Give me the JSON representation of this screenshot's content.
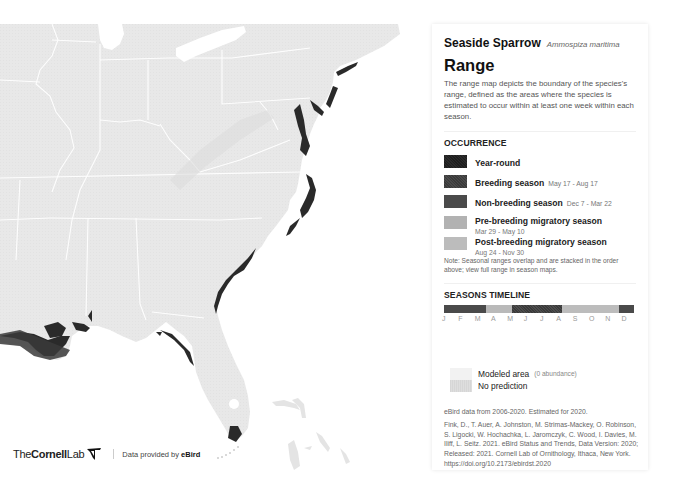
{
  "map": {
    "region": "Eastern United States",
    "footer": {
      "logo_the": "The",
      "logo_cornell": "Cornell",
      "logo_lab": "Lab",
      "data_credit_prefix": "Data provided by ",
      "data_credit_brand": "eBird"
    }
  },
  "panel": {
    "species_common": "Seaside Sparrow",
    "species_scientific": "Ammospiza maritima",
    "title": "Range",
    "description": "The range map depicts the boundary of the species's range, defined as the areas where the species is estimated to occur within at least one week within each season.",
    "occurrence": {
      "heading": "OCCURRENCE",
      "items": [
        {
          "label": "Year-round",
          "dates": "",
          "color": "#222222"
        },
        {
          "label": "Breeding season",
          "dates": "May 17 - Aug 17",
          "color": "#404040"
        },
        {
          "label": "Non-breeding season",
          "dates": "Dec 7 - Mar 22",
          "color": "#4a4a4a"
        },
        {
          "label": "Pre-breeding migratory season",
          "dates": "Mar 29 - May 10",
          "color": "#b2b2b2"
        },
        {
          "label": "Post-breeding migratory season",
          "dates": "Aug 24 - Nov 30",
          "color": "#bcbcbc"
        }
      ],
      "note": "Note: Seasonal ranges overlap and are stacked in the order above; view full range in season maps."
    },
    "timeline": {
      "heading": "SEASONS TIMELINE",
      "months": [
        "J",
        "F",
        "M",
        "A",
        "M",
        "J",
        "J",
        "A",
        "S",
        "O",
        "N",
        "D"
      ]
    },
    "modeled": {
      "modeled_label": "Modeled area",
      "modeled_sub": "(0 abundance)",
      "no_prediction_label": "No prediction"
    },
    "data_years": "eBird data from 2006-2020. Estimated for 2020.",
    "citation": "Fink, D., T. Auer, A. Johnston, M. Strimas-Mackey, O. Robinson, S. Ligocki, W. Hochachka, L. Jaromczyk, C. Wood, I. Davies, M. Iliff, L. Seitz. 2021. eBird Status and Trends, Data Version: 2020; Released: 2021. Cornell Lab of Ornithology, Ithaca, New York. https://doi.org/10.2173/ebirdst.2020"
  }
}
